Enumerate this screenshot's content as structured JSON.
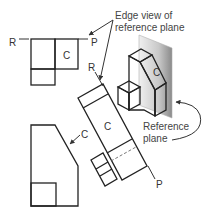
{
  "figure": {
    "labels": {
      "r_top": "R",
      "p_top": "P",
      "c_top": "C",
      "r_aux": "R",
      "p_aux": "P",
      "c_aux": "C",
      "c_front": "C",
      "c_iso": "C"
    },
    "annotations": {
      "edge_view_line1": "Edge view of",
      "edge_view_line2": "reference plane",
      "reference_line1": "Reference",
      "reference_line2": "plane"
    },
    "colors": {
      "line": "#222222",
      "text": "#333333",
      "plane_light": "#e6e6e6",
      "plane_dark": "#9a9a9a"
    }
  }
}
